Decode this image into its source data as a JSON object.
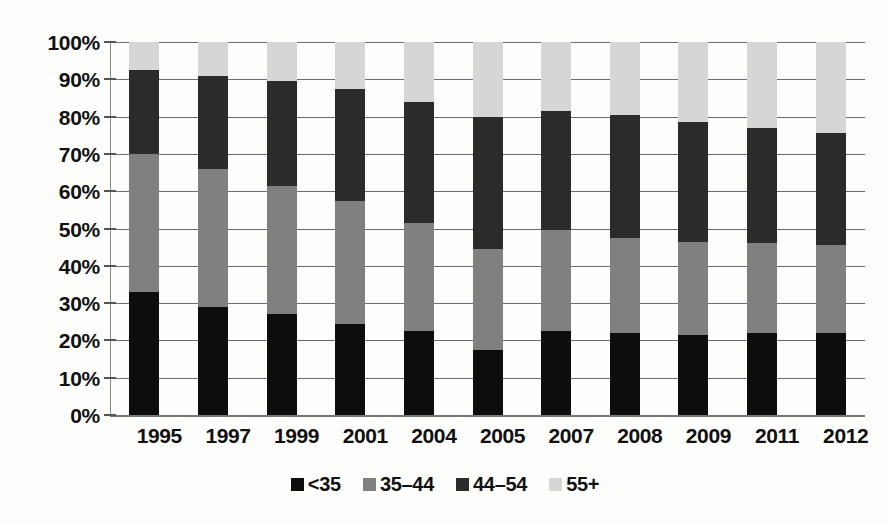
{
  "chart_data": {
    "type": "bar",
    "subtype": "stacked-percentage",
    "title": "",
    "subtitle": "",
    "xlabel": "",
    "ylabel": "",
    "categories": [
      "1995",
      "1997",
      "1999",
      "2001",
      "2004",
      "2005",
      "2007",
      "2008",
      "2009",
      "2011",
      "2012"
    ],
    "series": [
      {
        "name": "<35",
        "color": "#0d0d0d",
        "values": [
          33,
          29,
          27,
          24.5,
          22.5,
          17.5,
          22.5,
          22,
          21.5,
          22,
          22
        ]
      },
      {
        "name": "35–44",
        "color": "#808080",
        "values": [
          37,
          37,
          34.5,
          33,
          29,
          27,
          27,
          25.5,
          25,
          24,
          23.5
        ]
      },
      {
        "name": "44–54",
        "color": "#2b2b2b",
        "values": [
          22.5,
          25,
          28,
          30,
          32.5,
          35.5,
          32,
          33,
          32,
          31,
          30
        ]
      },
      {
        "name": "55+",
        "color": "#d6d6d6",
        "values": [
          7.5,
          9,
          10.5,
          12.5,
          16,
          20,
          18.5,
          19.5,
          21.5,
          23,
          24.5
        ]
      }
    ],
    "cumulative_tops": [
      [
        33,
        70,
        92.5,
        100
      ],
      [
        29,
        66,
        91,
        100
      ],
      [
        27,
        61.5,
        89.5,
        100
      ],
      [
        24.5,
        57.5,
        87.5,
        100
      ],
      [
        22.5,
        51.5,
        84,
        100
      ],
      [
        17.5,
        44.5,
        80,
        100
      ],
      [
        22.5,
        49.5,
        81.5,
        100
      ],
      [
        22,
        47.5,
        80.5,
        100
      ],
      [
        21.5,
        46.5,
        78.5,
        100
      ],
      [
        22,
        46,
        77,
        100
      ],
      [
        22,
        45.5,
        75.5,
        100
      ]
    ],
    "ylim": [
      0,
      100
    ],
    "y_ticks": [
      0,
      10,
      20,
      30,
      40,
      50,
      60,
      70,
      80,
      90,
      100
    ],
    "y_tick_labels": [
      "0%",
      "10%",
      "20%",
      "30%",
      "40%",
      "50%",
      "60%",
      "70%",
      "80%",
      "90%",
      "100%"
    ],
    "grid": true,
    "grid_axis": "y",
    "legend_position": "bottom",
    "legend_entries": [
      "<35",
      "35–44",
      "44–54",
      "55+"
    ]
  },
  "colors": {
    "under35": "#0d0d0d",
    "age35_44": "#808080",
    "age44_54": "#2b2b2b",
    "age55plus": "#d6d6d6",
    "gridline": "#6e6e6e",
    "axis": "#777777",
    "background": "#fdfdfc",
    "text": "#111111"
  }
}
